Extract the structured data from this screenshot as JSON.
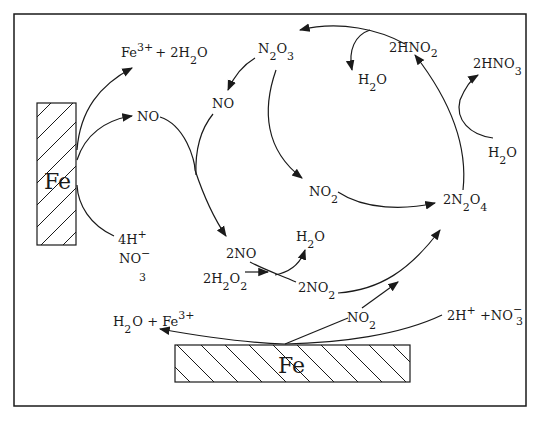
{
  "diagram": {
    "type": "reaction-cycle",
    "electrodes": {
      "left": {
        "label": "Fe"
      },
      "bottom": {
        "label": "Fe"
      }
    },
    "labels": {
      "fe3_2h2o": {
        "main": "Fe",
        "sup": "3+",
        "rest": "+ 2H",
        "sub": "2",
        "tail": "O"
      },
      "no_left": "NO",
      "h_no3_left": {
        "line1": "4H",
        "line1_sup": "+",
        "line2": "NO",
        "line2_sup": "−",
        "line2_sub": "3"
      },
      "n2o3": {
        "a": "N",
        "sub1": "2",
        "b": "O",
        "sub2": "3"
      },
      "no_mid": "NO",
      "h2o_top": {
        "a": "H",
        "sub": "2",
        "b": "O"
      },
      "hno2": {
        "a": "2HNO",
        "sub": "2"
      },
      "hno3": {
        "a": "2HNO",
        "sub": "3"
      },
      "h2o_right": {
        "a": "H",
        "sub": "2",
        "b": "O"
      },
      "no2_mid": {
        "a": "NO",
        "sub": "2"
      },
      "n2o4": {
        "a": "2N",
        "sub1": "2",
        "b": "O",
        "sub2": "4"
      },
      "two_no": "2NO",
      "h2o_small": {
        "a": "H",
        "sub": "2",
        "b": "O"
      },
      "h2o2": {
        "a": "2H",
        "sub1": "2",
        "b": "O",
        "sub2": "2"
      },
      "two_no2": {
        "a": "2NO",
        "sub": "2"
      },
      "no2_bottom": {
        "a": "NO",
        "sub": "2"
      },
      "h2o_fe3_bottom": {
        "a": "H",
        "sub": "2",
        "b": "O + Fe",
        "sup": "3+"
      },
      "h_no3_right": {
        "a": "2H",
        "sup1": "+",
        "b": " +NO",
        "sup2": "−",
        "sub": "3"
      }
    }
  }
}
